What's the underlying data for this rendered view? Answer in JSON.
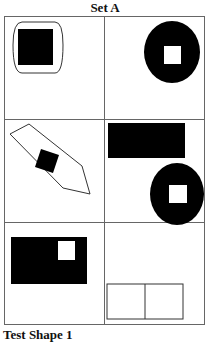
{
  "title": "Set A",
  "caption": "Test Shape 1",
  "colors": {
    "ink": "#000000",
    "grid": "#666666",
    "background": "#ffffff"
  },
  "cells": [
    {
      "row": 1,
      "col": 1,
      "description": "rounded rectangle outline containing a black square"
    },
    {
      "row": 1,
      "col": 2,
      "description": "black circle with a white square in center"
    },
    {
      "row": 2,
      "col": 1,
      "description": "tilted pencil-shaped outline containing a black rotated square"
    },
    {
      "row": 2,
      "col": 2,
      "description": "black rectangle above a black circle with a white square"
    },
    {
      "row": 3,
      "col": 1,
      "description": "black rectangle with a white square in upper right"
    },
    {
      "row": 3,
      "col": 2,
      "description": "rectangle outline divided into two squares"
    }
  ]
}
